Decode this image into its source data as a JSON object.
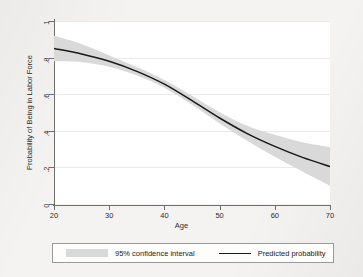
{
  "chart_data": {
    "type": "line",
    "title": "",
    "subtitle": "",
    "xlabel": "Age",
    "ylabel": "Probability of Being in Labor Force",
    "xlim": [
      20,
      70
    ],
    "ylim": [
      0,
      1
    ],
    "grid": "horizontal",
    "legend_position": "bottom",
    "xticks": [
      "20",
      "30",
      "40",
      "50",
      "60",
      "70"
    ],
    "xtick_values": [
      20,
      30,
      40,
      50,
      60,
      70
    ],
    "yticks": [
      "0",
      ".2",
      ".4",
      ".6",
      ".8",
      "1"
    ],
    "ytick_values": [
      0,
      0.2,
      0.4,
      0.6,
      0.8,
      1
    ],
    "x": [
      20,
      25,
      30,
      35,
      40,
      45,
      50,
      55,
      60,
      65,
      70
    ],
    "series": [
      {
        "name": "Predicted probability",
        "type": "line",
        "color": "#1a1a1a",
        "values": [
          0.85,
          0.82,
          0.78,
          0.725,
          0.655,
          0.565,
          0.47,
          0.385,
          0.315,
          0.255,
          0.205
        ]
      },
      {
        "name": "95% confidence interval",
        "type": "band",
        "color": "#d9d9d9",
        "lower": [
          0.78,
          0.775,
          0.75,
          0.702,
          0.635,
          0.542,
          0.44,
          0.345,
          0.258,
          0.178,
          0.1
        ],
        "upper": [
          0.92,
          0.875,
          0.812,
          0.748,
          0.678,
          0.592,
          0.502,
          0.428,
          0.378,
          0.338,
          0.312
        ]
      }
    ],
    "legend": [
      {
        "label": "95% confidence interval",
        "marker": "band",
        "color": "#d9d9d9"
      },
      {
        "label": "Predicted probability",
        "marker": "line",
        "color": "#1a1a1a"
      }
    ]
  },
  "axes": {
    "x_title": "Age",
    "y_title": "Probability of Being in Labor Force"
  },
  "legend": {
    "ci_label": "95% confidence interval",
    "pp_label": "Predicted probability"
  },
  "colors": {
    "band": "#d9d9d9",
    "line": "#1a1a1a",
    "axis": "#6f6f6f",
    "grid": "#e9e9e9",
    "plot_bg": "#ffffff",
    "page_bg": "#f4f3f1"
  }
}
